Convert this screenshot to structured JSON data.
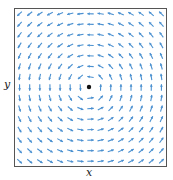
{
  "chart_data": {
    "type": "quiver",
    "title": "",
    "xlabel": "x",
    "ylabel": "y",
    "field": "rotational (counterclockwise): F(x,y) = (-y, x)",
    "grid": false,
    "legend": null,
    "xlim": [
      -1,
      1
    ],
    "ylim": [
      -1,
      1
    ],
    "grid_points_per_axis": 15,
    "center_point": [
      0,
      0
    ],
    "arrow_color": "#4a90d0",
    "center_color": "#111111",
    "frame_color": "#555555"
  },
  "labels": {
    "x": "x",
    "y": "y"
  }
}
